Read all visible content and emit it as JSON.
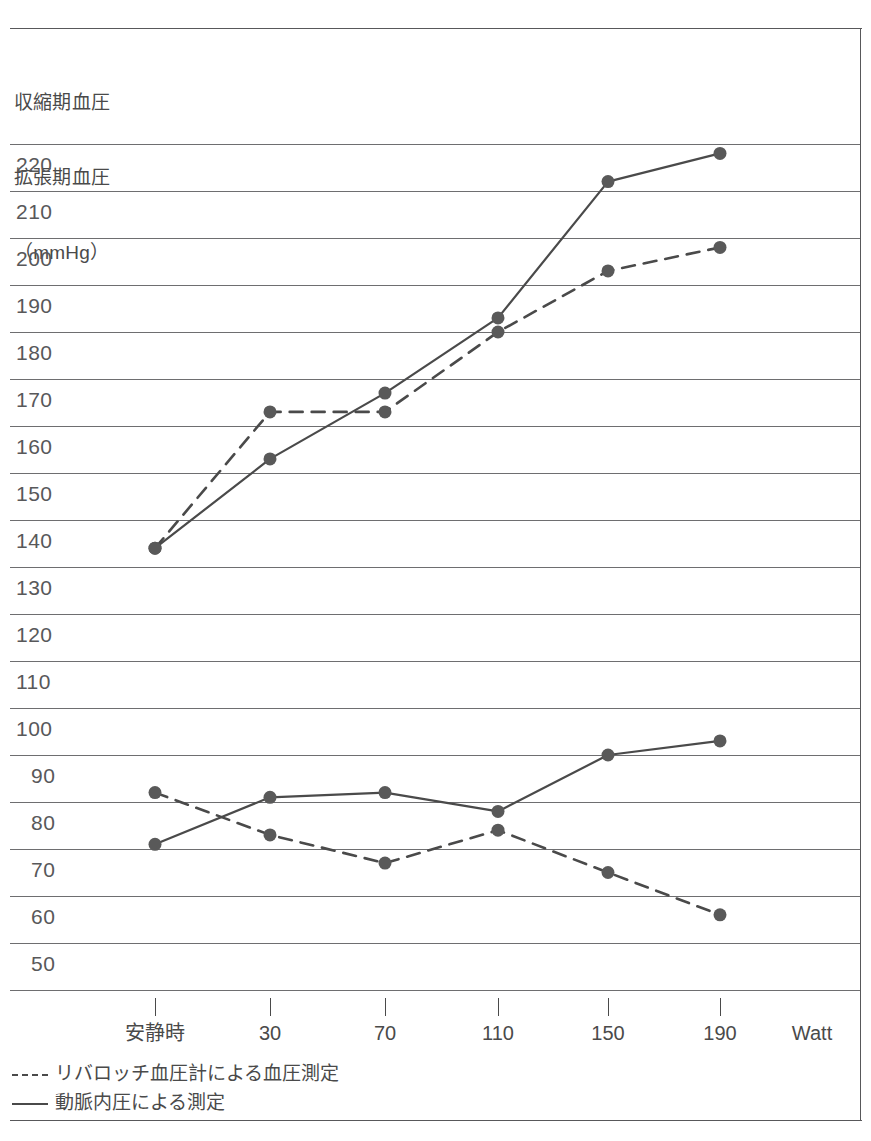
{
  "chart_data": {
    "type": "line",
    "title": "",
    "ylabel_lines": [
      "収縮期血圧",
      "拡張期血圧",
      "（mmHg）"
    ],
    "xlabel": "Watt",
    "x_unit_label": "Watt",
    "categories": [
      "安静時",
      "30",
      "70",
      "110",
      "150",
      "190"
    ],
    "x_positions_px": [
      155,
      270,
      385,
      498,
      608,
      720
    ],
    "ylim": [
      45,
      225
    ],
    "yticks": [
      220,
      210,
      200,
      190,
      180,
      170,
      160,
      150,
      140,
      130,
      120,
      110,
      100,
      90,
      80,
      70,
      60,
      50
    ],
    "grid": true,
    "legend_position": "below-axis",
    "series": [
      {
        "name": "リバロッチ血圧計による血圧測定",
        "style": "dashed",
        "measure": "systolic",
        "values": [
          134,
          163,
          163,
          180,
          193,
          198
        ]
      },
      {
        "name": "動脈内圧による測定",
        "style": "solid",
        "measure": "systolic",
        "values": [
          134,
          153,
          167,
          183,
          212,
          218
        ]
      },
      {
        "name": "リバロッチ血圧計による血圧測定",
        "style": "dashed",
        "measure": "diastolic",
        "values": [
          82,
          73,
          67,
          74,
          65,
          56
        ]
      },
      {
        "name": "動脈内圧による測定",
        "style": "solid",
        "measure": "diastolic",
        "values": [
          71,
          81,
          82,
          78,
          90,
          93
        ]
      }
    ]
  },
  "legend": {
    "items": [
      {
        "label": "リバロッチ血圧計による血圧測定",
        "style": "dashed"
      },
      {
        "label": "動脈内圧による測定",
        "style": "solid"
      }
    ]
  },
  "colors": {
    "line": "#4a4a4a",
    "marker": "#595959",
    "grid": "#6e6e70",
    "frame": "#58585a",
    "text": "#4a4a4a"
  }
}
